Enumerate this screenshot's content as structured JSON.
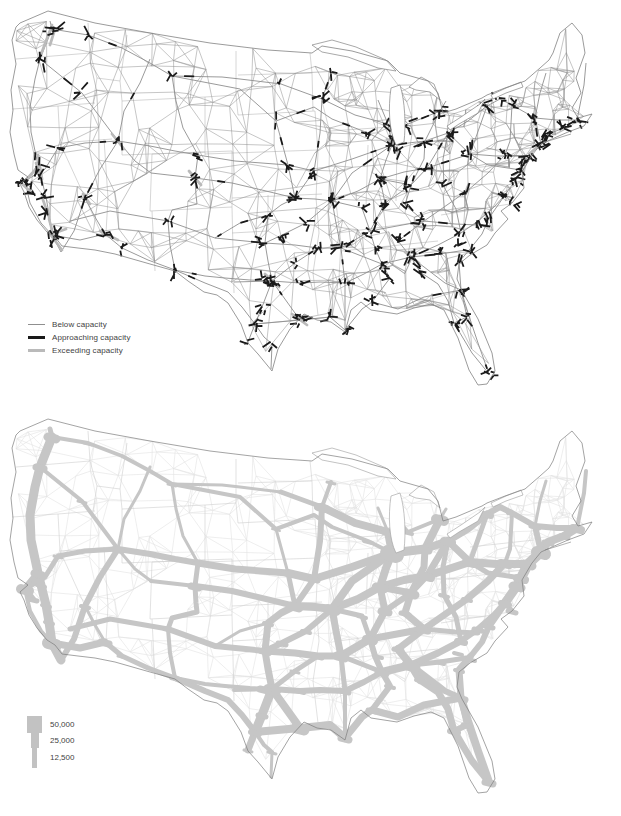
{
  "top_map": {
    "legend": {
      "items": [
        {
          "label": "Below capacity",
          "color": "#8f8f8f",
          "thickness": 1
        },
        {
          "label": "Approaching capacity",
          "color": "#1a1a1a",
          "thickness": 3
        },
        {
          "label": "Exceeding capacity",
          "color": "#bababa",
          "thickness": 3
        }
      ]
    },
    "colors": {
      "road": "#8f8f8f",
      "approaching": "#1a1a1a",
      "exceeding": "#bababa",
      "outline": "#828282",
      "state_line": "#b3b3b3"
    }
  },
  "bottom_map": {
    "legend": {
      "items": [
        {
          "label": "50,000",
          "bar_width": 15,
          "bar_height": 17
        },
        {
          "label": "25,000",
          "bar_width": 8,
          "bar_height": 15
        },
        {
          "label": "12,500",
          "bar_width": 5,
          "bar_height": 20
        }
      ],
      "symbol_color": "#c2c2c2"
    },
    "colors": {
      "flow": "#c6c6c6",
      "outline": "#7d7d7d",
      "state_line": "#cfcfcf",
      "mesh": "#e2e2e2"
    }
  }
}
